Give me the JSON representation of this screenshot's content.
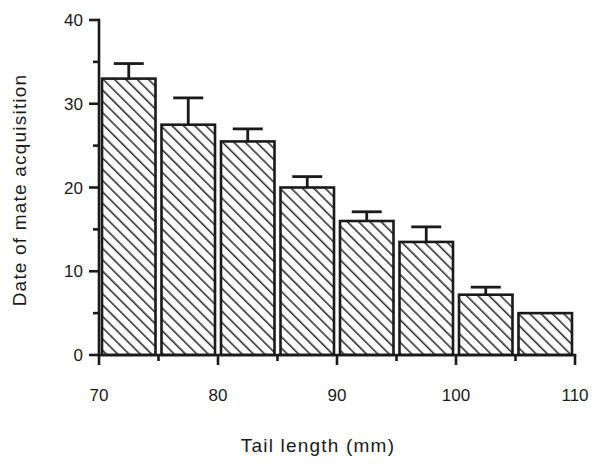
{
  "chart_data": {
    "type": "bar",
    "title": "",
    "subtitle": "",
    "xlabel": "Tail  length  (mm)",
    "ylabel": "Date of mate acquisition",
    "categories": [
      "70-75",
      "75-80",
      "80-85",
      "85-90",
      "90-95",
      "95-100",
      "100-105",
      "105-110"
    ],
    "x_bin_starts": [
      70,
      75,
      80,
      85,
      90,
      95,
      100,
      105
    ],
    "x_bin_width": 5,
    "values": [
      33,
      27.5,
      25.5,
      20,
      16,
      13.5,
      7.2,
      5
    ],
    "errors": [
      1.8,
      3.2,
      1.5,
      1.3,
      1.1,
      1.8,
      0.9,
      null
    ],
    "error_type": "se-upper-only",
    "xlim": [
      70,
      110
    ],
    "ylim": [
      0,
      40
    ],
    "x_ticks": [
      70,
      75,
      80,
      85,
      90,
      95,
      100,
      105,
      110
    ],
    "x_tick_labels": [
      "70",
      "",
      "80",
      "",
      "90",
      "",
      "100",
      "",
      "110"
    ],
    "x_major_ticks": [
      70,
      80,
      90,
      100,
      110
    ],
    "y_ticks": [
      0,
      5,
      10,
      15,
      20,
      25,
      30,
      35,
      40
    ],
    "y_tick_labels": [
      "0",
      "",
      "10",
      "",
      "20",
      "",
      "30",
      "",
      "40"
    ],
    "y_major_ticks": [
      0,
      10,
      20,
      30,
      40
    ],
    "grid": false,
    "legend": false,
    "bar_fill": "hatch-diagonal",
    "bar_edge_color": "#1a1a1a",
    "bar_hatch_color": "#2b2b2b",
    "background": "#ffffff"
  },
  "axes": {
    "y_labels": [
      "40",
      "30",
      "20",
      "10",
      "0"
    ],
    "x_labels": [
      "70",
      "80",
      "90",
      "100",
      "110"
    ]
  },
  "labels": {
    "x_axis_title": "Tail  length  (mm)",
    "y_axis_title": "Date of mate acquisition"
  }
}
